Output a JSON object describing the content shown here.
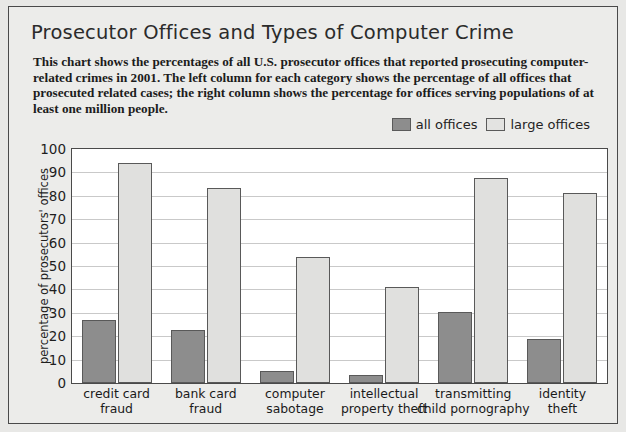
{
  "figure": {
    "title": "Prosecutor Offices and Types of Computer Crime",
    "description": "This chart shows the percentages of all U.S. prosecutor offices that reported prosecuting computer-related crimes in 2001. The left column for each category shows the percentage of all offices that prosecuted related cases; the right column shows the percentage for offices serving populations of at least one million people."
  },
  "colors": {
    "all_offices": "#8d8d8d",
    "large_offices": "#e0e0de",
    "bar_outline": "#595959",
    "frame": "#4a4a4a",
    "page_background": "#ececea",
    "plot_background": "#ffffff",
    "gridline": "#c9c9c9"
  },
  "chart_data": {
    "type": "bar",
    "title": "Prosecutor Offices and Types of Computer Crime",
    "xlabel": "",
    "ylabel": "percentage of prosecutors' offices",
    "ylim": [
      0,
      100
    ],
    "yticks": [
      0,
      10,
      20,
      30,
      40,
      50,
      60,
      70,
      80,
      90,
      100
    ],
    "grid": true,
    "legend_position": "above-right",
    "categories": [
      "credit card fraud",
      "bank card fraud",
      "computer sabotage",
      "intellectual property theft",
      "transmitting child pornography",
      "identity theft"
    ],
    "category_lines": [
      [
        "credit card",
        "fraud"
      ],
      [
        "bank card",
        "fraud"
      ],
      [
        "computer",
        "sabotage"
      ],
      [
        "intellectual",
        "property theft"
      ],
      [
        "transmitting",
        "child pornography"
      ],
      [
        "identity",
        "theft"
      ]
    ],
    "series": [
      {
        "name": "all offices",
        "values": [
          27,
          22.5,
          5,
          3.5,
          30.5,
          19
        ]
      },
      {
        "name": "large offices",
        "values": [
          94,
          83.5,
          54,
          41,
          87.5,
          81
        ]
      }
    ]
  }
}
